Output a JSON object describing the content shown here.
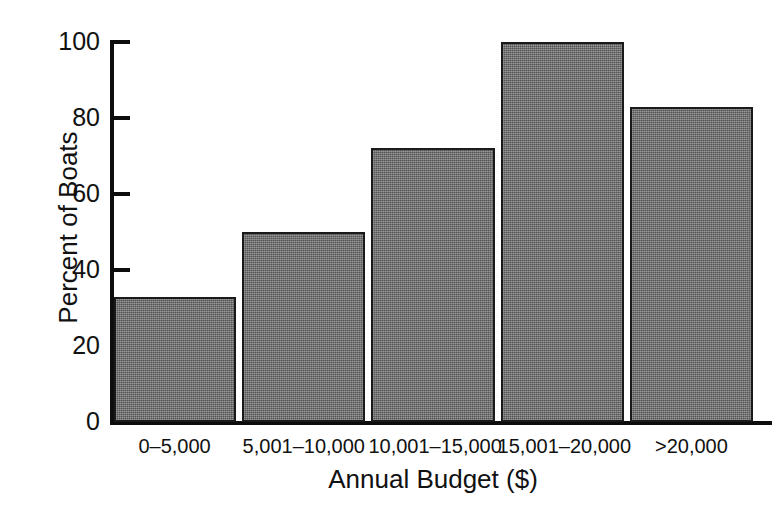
{
  "chart_data": {
    "type": "bar",
    "title": "",
    "subtitle": "",
    "xlabel": "Annual Budget ($)",
    "ylabel": "Percent of Boats",
    "categories": [
      "0–5,000",
      "5,001–10,000",
      "10,001–15,000",
      "15,001–20,000",
      ">20,000"
    ],
    "values": [
      33,
      50,
      72,
      100,
      83
    ],
    "ylim": [
      0,
      100
    ],
    "yticks": [
      0,
      20,
      40,
      60,
      80,
      100
    ],
    "ytick_labels": [
      "0",
      "20",
      "40",
      "60",
      "80",
      "100"
    ],
    "grid": false,
    "legend": null,
    "legend_position": "none",
    "bar_color": "#6e6e6e",
    "bar_edge_color": "#1a1a1a",
    "axis_color": "#0d0d0d",
    "background_color": "#ffffff"
  }
}
